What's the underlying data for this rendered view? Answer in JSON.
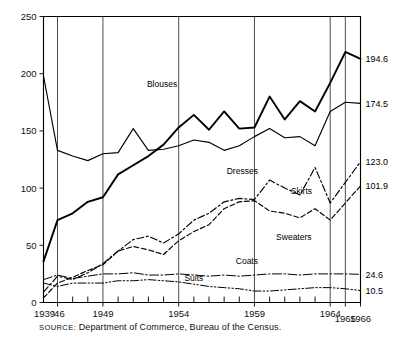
{
  "chart_data": {
    "type": "line",
    "title": "",
    "subtitle": "",
    "xlabel": "",
    "ylabel": "",
    "source_prefix": "SOURCE:",
    "source_text": "Department of Commerce, Bureau of the Census.",
    "grid": true,
    "legend_position": "inline-series-labels",
    "xlim": [
      1939,
      1966
    ],
    "ylim": [
      0,
      250
    ],
    "yticks": [
      0,
      50,
      100,
      150,
      200,
      250
    ],
    "ytick_labels": [
      "0",
      "50",
      "100",
      "150",
      "200",
      "250"
    ],
    "xtick_labels": [
      "1939",
      "'46",
      "1949",
      "1954",
      "1959",
      "1964",
      "1965",
      "1966"
    ],
    "xtick_values": [
      1939,
      1946,
      1949,
      1954,
      1959,
      1964,
      1965,
      1966
    ],
    "gridline_years": [
      1946,
      1949,
      1954,
      1959,
      1964,
      1965,
      1966
    ],
    "minor_tick_years": [
      1947,
      1948,
      1950,
      1951,
      1952,
      1953,
      1955,
      1956,
      1957,
      1958,
      1960,
      1961,
      1962,
      1963
    ],
    "end_value_labels": [
      {
        "series": "Blouses",
        "value": "194.6"
      },
      {
        "series": "Dresses",
        "value": "174.5"
      },
      {
        "series": "Skirts",
        "value": "123.0"
      },
      {
        "series": "Sweaters",
        "value": "101.9"
      },
      {
        "series": "Coats",
        "value": "24.6"
      },
      {
        "series": "Suits",
        "value": "10.5"
      }
    ],
    "series": [
      {
        "name": "Blouses",
        "label": "Blouses",
        "style": "solid-thick",
        "x": [
          1939,
          1946,
          1947,
          1948,
          1949,
          1950,
          1951,
          1952,
          1953,
          1954,
          1955,
          1956,
          1957,
          1958,
          1959,
          1960,
          1961,
          1962,
          1963,
          1964,
          1965,
          1966
        ],
        "values": [
          36,
          72,
          78,
          88,
          92,
          112,
          120,
          128,
          138,
          153,
          164,
          151,
          167,
          152,
          153,
          180,
          160,
          176,
          167,
          192,
          219,
          213
        ]
      },
      {
        "name": "Dresses",
        "label": "Dresses",
        "style": "solid-thin",
        "x": [
          1939,
          1946,
          1947,
          1948,
          1949,
          1950,
          1951,
          1952,
          1953,
          1954,
          1955,
          1956,
          1957,
          1958,
          1959,
          1960,
          1961,
          1962,
          1963,
          1964,
          1965,
          1966
        ],
        "values": [
          198,
          133,
          128,
          124,
          130,
          131,
          152,
          133,
          134,
          137,
          142,
          140,
          133,
          137,
          145,
          152,
          144,
          145,
          137,
          167,
          175,
          174
        ]
      },
      {
        "name": "Skirts",
        "label": "Skirts",
        "style": "dash-dot",
        "x": [
          1939,
          1946,
          1947,
          1948,
          1949,
          1950,
          1951,
          1952,
          1953,
          1954,
          1955,
          1956,
          1957,
          1958,
          1959,
          1960,
          1961,
          1962,
          1963,
          1964,
          1965,
          1966
        ],
        "values": [
          9,
          23,
          20,
          26,
          34,
          45,
          55,
          58,
          52,
          60,
          72,
          78,
          88,
          91,
          90,
          107,
          100,
          94,
          118,
          87,
          105,
          123
        ]
      },
      {
        "name": "Sweaters",
        "label": "Sweaters",
        "style": "dashed",
        "x": [
          1939,
          1946,
          1947,
          1948,
          1949,
          1950,
          1951,
          1952,
          1953,
          1954,
          1955,
          1956,
          1957,
          1958,
          1959,
          1960,
          1961,
          1962,
          1963,
          1964,
          1965,
          1966
        ],
        "values": [
          4,
          17,
          22,
          28,
          33,
          45,
          49,
          46,
          42,
          54,
          62,
          68,
          82,
          88,
          89,
          80,
          78,
          74,
          82,
          72,
          87,
          101.9
        ]
      },
      {
        "name": "Coats",
        "label": "Coats",
        "style": "dash-dot-thin",
        "x": [
          1939,
          1946,
          1947,
          1948,
          1949,
          1950,
          1951,
          1952,
          1953,
          1954,
          1955,
          1956,
          1957,
          1958,
          1959,
          1960,
          1961,
          1962,
          1963,
          1964,
          1965,
          1966
        ],
        "values": [
          20,
          24,
          21,
          23,
          25,
          25,
          26,
          24,
          24,
          25,
          24,
          23,
          24,
          23,
          24,
          25,
          25,
          24,
          25,
          25,
          25,
          24.6
        ]
      },
      {
        "name": "Suits",
        "label": "Suits",
        "style": "dash-dot-dot",
        "x": [
          1939,
          1946,
          1947,
          1948,
          1949,
          1950,
          1951,
          1952,
          1953,
          1954,
          1955,
          1956,
          1957,
          1958,
          1959,
          1960,
          1961,
          1962,
          1963,
          1964,
          1965,
          1966
        ],
        "values": [
          17,
          14,
          17,
          17,
          17,
          19,
          19,
          20,
          19,
          18,
          16,
          14,
          13,
          12,
          10,
          10,
          11,
          12,
          13,
          13,
          12,
          10.5
        ]
      }
    ],
    "annotations": [
      {
        "text": "Blouses",
        "x": 1952.9,
        "y": 188
      },
      {
        "text": "Dresses",
        "x": 1958.2,
        "y": 112
      },
      {
        "text": "Skirts",
        "x": 1962.1,
        "y": 95
      },
      {
        "text": "Sweaters",
        "x": 1961.6,
        "y": 55
      },
      {
        "text": "Coats",
        "x": 1958.5,
        "y": 34
      },
      {
        "text": "Suits",
        "x": 1955.0,
        "y": 19
      }
    ]
  }
}
